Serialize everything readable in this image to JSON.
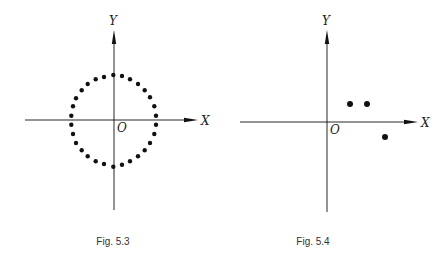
{
  "figures": [
    {
      "id": "fig-5-3",
      "caption": "Fig. 5.3",
      "x_label": "X",
      "y_label": "Y",
      "origin_label": "O",
      "origin": [
        114,
        120
      ],
      "x_axis": [
        25,
        198
      ],
      "y_axis": [
        30,
        210
      ],
      "label_pos": {
        "x": [
          201,
          125
        ],
        "y": [
          109,
          25
        ],
        "o": [
          117,
          132
        ],
        "caption": [
          113,
          245
        ]
      },
      "dots": [
        [
          71.3,
          115.7
        ],
        [
          73,
          106.3
        ],
        [
          76,
          98.3
        ],
        [
          81.7,
          90.3
        ],
        [
          87.7,
          84
        ],
        [
          95.7,
          79.3
        ],
        [
          104,
          77
        ],
        [
          113.3,
          75
        ],
        [
          122,
          76
        ],
        [
          130,
          79.3
        ],
        [
          138,
          84
        ],
        [
          144.7,
          90.3
        ],
        [
          150,
          97.3
        ],
        [
          154.3,
          106.3
        ],
        [
          156,
          115.7
        ],
        [
          71.3,
          124.7
        ],
        [
          73,
          134
        ],
        [
          76,
          143
        ],
        [
          81.7,
          150.3
        ],
        [
          87.7,
          156.3
        ],
        [
          95.7,
          161.3
        ],
        [
          104,
          164
        ],
        [
          113.3,
          166.7
        ],
        [
          122,
          164.7
        ],
        [
          130,
          161.3
        ],
        [
          138,
          156.3
        ],
        [
          144.7,
          150.3
        ],
        [
          150,
          143
        ],
        [
          154.3,
          134
        ],
        [
          156,
          124.7
        ]
      ],
      "dot_radius": 2.2
    },
    {
      "id": "fig-5-4",
      "caption": "Fig. 5.4",
      "x_label": "X",
      "y_label": "Y",
      "origin_label": "O",
      "origin": [
        327,
        122
      ],
      "x_axis": [
        240,
        418
      ],
      "y_axis": [
        30,
        212
      ],
      "label_pos": {
        "x": [
          421,
          127
        ],
        "y": [
          322,
          25
        ],
        "o": [
          330,
          134
        ],
        "caption": [
          313,
          245
        ]
      },
      "dots": [
        [
          350,
          104
        ],
        [
          367,
          104
        ],
        [
          385,
          137
        ]
      ],
      "dot_radius": 3
    }
  ],
  "colors": {
    "ink": "#111111",
    "caption": "#333333",
    "background": "#ffffff"
  }
}
